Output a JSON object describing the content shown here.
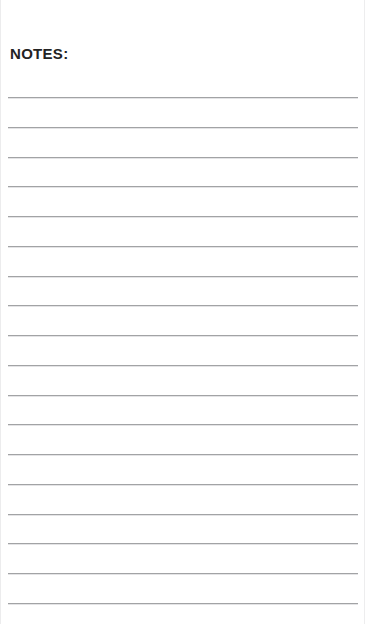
{
  "page": {
    "width": 365,
    "height": 624,
    "background_color": "#ffffff",
    "edge_color": "#ececed"
  },
  "header": {
    "title": "NOTES:",
    "color": "#232323",
    "left": 10,
    "top": 44,
    "font_size": 15
  },
  "ruling": {
    "line_color": "#a2a3a5",
    "line_count": 18,
    "line_thickness": 1,
    "first_line_y": 97,
    "line_spacing": 29.75,
    "left_margin": 8,
    "right_margin": 7,
    "lines": [
      {
        "index": 1,
        "y": 97
      },
      {
        "index": 2,
        "y": 126.8
      },
      {
        "index": 3,
        "y": 156.5
      },
      {
        "index": 4,
        "y": 186.3
      },
      {
        "index": 5,
        "y": 216
      },
      {
        "index": 6,
        "y": 245.8
      },
      {
        "index": 7,
        "y": 275.5
      },
      {
        "index": 8,
        "y": 305.3
      },
      {
        "index": 9,
        "y": 335
      },
      {
        "index": 10,
        "y": 364.8
      },
      {
        "index": 11,
        "y": 394.5
      },
      {
        "index": 12,
        "y": 424.3
      },
      {
        "index": 13,
        "y": 454
      },
      {
        "index": 14,
        "y": 483.8
      },
      {
        "index": 15,
        "y": 513.5
      },
      {
        "index": 16,
        "y": 543.3
      },
      {
        "index": 17,
        "y": 573
      },
      {
        "index": 18,
        "y": 602.8
      }
    ],
    "content": [
      "",
      "",
      "",
      "",
      "",
      "",
      "",
      "",
      "",
      "",
      "",
      "",
      "",
      "",
      "",
      "",
      "",
      ""
    ]
  }
}
